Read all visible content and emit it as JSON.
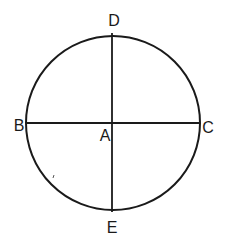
{
  "diagram": {
    "type": "circle-with-perpendicular-diameters",
    "stroke_color": "#1a1a1a",
    "background_color": "#ffffff",
    "circle": {
      "cx": 113,
      "cy": 123,
      "r": 87
    },
    "lines": [
      {
        "name": "diameter-BC",
        "from": "B",
        "to": "C",
        "x1": 27,
        "y1": 123,
        "x2": 200,
        "y2": 123
      },
      {
        "name": "diameter-DE",
        "from": "D",
        "to": "E",
        "x1": 112,
        "y1": 33,
        "x2": 112,
        "y2": 212
      }
    ],
    "points": {
      "A": {
        "label": "A",
        "x": 105,
        "y": 141
      },
      "B": {
        "label": "B",
        "x": 19,
        "y": 131
      },
      "C": {
        "label": "C",
        "x": 208,
        "y": 133
      },
      "D": {
        "label": "D",
        "x": 114,
        "y": 26
      },
      "E": {
        "label": "E",
        "x": 112,
        "y": 233
      }
    }
  }
}
